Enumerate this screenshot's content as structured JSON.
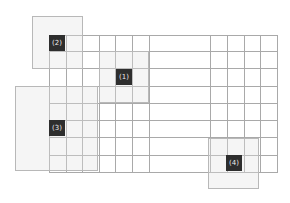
{
  "grid": {
    "left": 49,
    "top": 35,
    "right": 277,
    "bottom": 172,
    "columns_x": [
      49,
      66,
      82,
      99,
      115,
      132,
      149,
      210,
      227,
      244,
      260,
      277
    ],
    "rows_y": [
      35,
      51,
      68,
      86,
      103,
      120,
      137,
      155,
      172
    ],
    "line_color": "#a9a9a9"
  },
  "regions": [
    {
      "id": "1",
      "label": "(1)",
      "x": 99,
      "y": 51,
      "w": 50,
      "h": 52,
      "label_x": 116,
      "label_y": 69
    },
    {
      "id": "2",
      "label": "(2)",
      "x": 32,
      "y": 16,
      "w": 51,
      "h": 53,
      "label_x": 49,
      "label_y": 35
    },
    {
      "id": "3",
      "label": "(3)",
      "x": 15,
      "y": 86,
      "w": 83,
      "h": 85,
      "label_x": 49,
      "label_y": 120
    },
    {
      "id": "4",
      "label": "(4)",
      "x": 208,
      "y": 138,
      "w": 51,
      "h": 51,
      "label_x": 226,
      "label_y": 155
    }
  ],
  "colors": {
    "label_bg": "#2e2e2e",
    "label_text": "#ededed",
    "region_fill": "#e1e1e1"
  }
}
